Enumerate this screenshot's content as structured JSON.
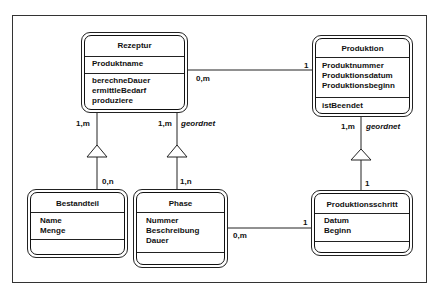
{
  "diagram": {
    "type": "UML class diagram",
    "classes": {
      "rezeptur": {
        "name": "Rezeptur",
        "attributes": [
          "Produktname"
        ],
        "operations": [
          "berechneDauer",
          "ermittleBedarf",
          "produziere"
        ]
      },
      "produktion": {
        "name": "Produktion",
        "attributes": [
          "Produktnummer",
          "Produktionsdatum",
          "Produktionsbeginn"
        ],
        "operations": [
          "istBeendet"
        ]
      },
      "bestandteil": {
        "name": "Bestandteil",
        "attributes": [
          "Name",
          "Menge"
        ],
        "operations": []
      },
      "phase": {
        "name": "Phase",
        "attributes": [
          "Nummer",
          "Beschreibung",
          "Dauer"
        ],
        "operations": []
      },
      "produktionsschritt": {
        "name": "Produktionsschritt",
        "attributes": [
          "Datum",
          "Beginn"
        ],
        "operations": []
      }
    },
    "associations": [
      {
        "from": "Rezeptur",
        "to": "Produktion",
        "from_mult": "0,m",
        "to_mult": "1",
        "kind": "association"
      },
      {
        "from": "Rezeptur",
        "to": "Bestandteil",
        "from_mult": "1,m",
        "to_mult": "0,n",
        "kind": "aggregation"
      },
      {
        "from": "Rezeptur",
        "to": "Phase",
        "from_mult": "1,m",
        "to_mult": "1,n",
        "kind": "aggregation",
        "constraint": "geordnet"
      },
      {
        "from": "Produktion",
        "to": "Produktionsschritt",
        "from_mult": "1,m",
        "to_mult": "1",
        "kind": "aggregation",
        "constraint": "geordnet"
      },
      {
        "from": "Phase",
        "to": "Produktionsschritt",
        "from_mult": "0,m",
        "to_mult": "1",
        "kind": "association"
      }
    ],
    "labels": {
      "rez_prod_left": "0,m",
      "rez_prod_right": "1",
      "rez_best_top": "1,m",
      "rez_best_bottom": "0,n",
      "rez_phase_top": "1,m",
      "rez_phase_constraint": "geordnet",
      "rez_phase_bottom": "1,n",
      "prod_schritt_top": "1,m",
      "prod_schritt_constraint": "geordnet",
      "prod_schritt_bottom": "1",
      "phase_schritt_left": "0,m",
      "phase_schritt_right": "1"
    }
  }
}
